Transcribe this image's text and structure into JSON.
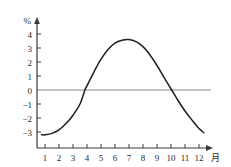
{
  "chart_data": {
    "type": "line",
    "title": "",
    "subtitle": "",
    "xlabel": "月",
    "ylabel": "%",
    "xlim": [
      0.4,
      12.6
    ],
    "ylim": [
      -3.6,
      4.6
    ],
    "grid": false,
    "legend": null,
    "zero_line": 0,
    "x_ticks": [
      1,
      2,
      3,
      4,
      5,
      6,
      7,
      8,
      9,
      10,
      11,
      12
    ],
    "x_tick_labels": [
      "1",
      "2",
      "3",
      "4",
      "5",
      "6",
      "7",
      "8",
      "9",
      "10",
      "11",
      "12"
    ],
    "y_ticks": [
      4,
      3,
      2,
      1,
      0,
      -1,
      -2,
      -3
    ],
    "y_tick_labels": [
      "4",
      "3",
      "2",
      "1",
      "0",
      "−1",
      "−2",
      "−3"
    ],
    "series": [
      {
        "name": "",
        "x": [
          0.75,
          1,
          1.5,
          2,
          2.5,
          3,
          3.5,
          3.85,
          4,
          4.5,
          5,
          5.5,
          6,
          6.5,
          7,
          7.5,
          8,
          8.5,
          9,
          9.5,
          10.05,
          10.5,
          11,
          11.5,
          12,
          12.35
        ],
        "values": [
          -3.2,
          -3.2,
          -3.1,
          -2.85,
          -2.4,
          -1.8,
          -1.0,
          0.0,
          0.3,
          1.3,
          2.2,
          2.9,
          3.35,
          3.55,
          3.6,
          3.45,
          3.1,
          2.5,
          1.75,
          0.9,
          0.0,
          -0.75,
          -1.5,
          -2.15,
          -2.75,
          -3.05
        ]
      }
    ],
    "annotations": [],
    "colors": {
      "curve": "#1f1f1f",
      "axis": "#3a3a3a",
      "zero_line": "#8a8a8a",
      "background": "#ffffff",
      "tick_text": "#2a2a2a"
    }
  },
  "axis_labels": {
    "y_unit": "%",
    "x_unit": "月"
  }
}
